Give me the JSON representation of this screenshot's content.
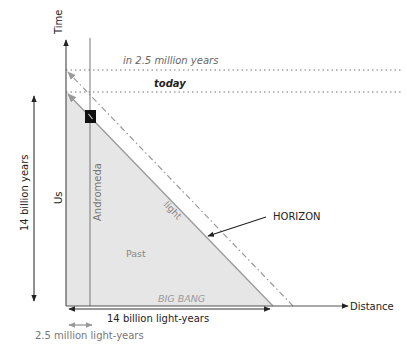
{
  "diagram": {
    "axes": {
      "time_label": "Time",
      "distance_label": "Distance"
    },
    "time_lines": {
      "future": "in 2.5 million years",
      "present": "today"
    },
    "worldlines": {
      "us": "Us",
      "andromeda": "Andromeda"
    },
    "regions": {
      "past": "Past",
      "light": "light",
      "big_bang": "BIG BANG"
    },
    "annotations": {
      "horizon": "HORIZON",
      "age_span": "14 billion years",
      "distance_span": "14 billion light-years",
      "andromeda_distance": "2.5 million light-years"
    },
    "colors": {
      "past_fill": "#e6e6e6",
      "light_edge": "#999999",
      "axis": "#333333",
      "dotted": "#777777",
      "galaxy_box": "#111111"
    }
  }
}
